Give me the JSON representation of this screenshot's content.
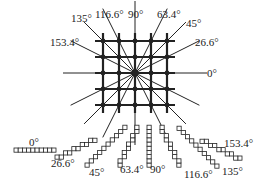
{
  "diagram": {
    "title": "",
    "center_label": "",
    "directions": [
      {
        "angle": 0,
        "label": "0°"
      },
      {
        "angle": 26.6,
        "label": "26.6°"
      },
      {
        "angle": 45,
        "label": "45°"
      },
      {
        "angle": 63.4,
        "label": "63.4°"
      },
      {
        "angle": 90,
        "label": "90°"
      },
      {
        "angle": 116.6,
        "label": "116.6°"
      },
      {
        "angle": 135,
        "label": "135°"
      },
      {
        "angle": 153.4,
        "label": "153.4°"
      }
    ],
    "grid": {
      "rows": 5,
      "cols": 5
    },
    "staircases": [
      {
        "label": "0°",
        "angle": 0
      },
      {
        "label": "26.6°",
        "angle": 26.6
      },
      {
        "label": "45°",
        "angle": 45
      },
      {
        "label": "63.4°",
        "angle": 63.4
      },
      {
        "label": "90°",
        "angle": 90
      },
      {
        "label": "116.6°",
        "angle": 116.6
      },
      {
        "label": "135°",
        "angle": 135
      },
      {
        "label": "153.4°",
        "angle": 153.4
      }
    ],
    "colors": {
      "line": "#222222",
      "background": "#ffffff"
    }
  }
}
